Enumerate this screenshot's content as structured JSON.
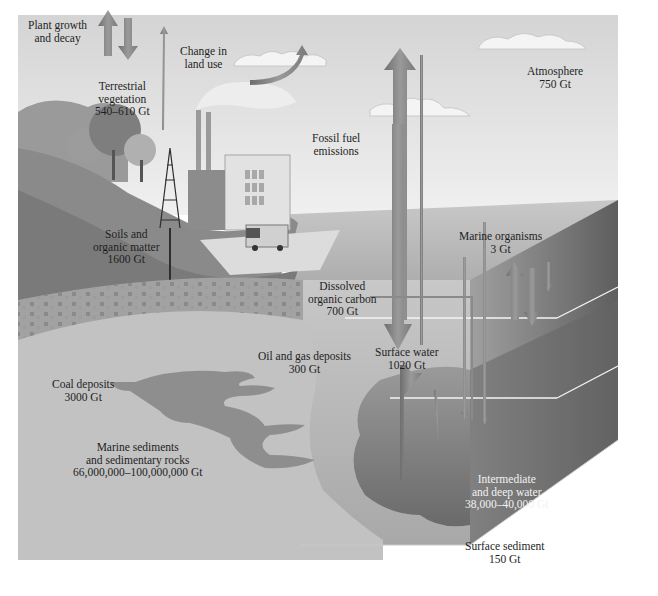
{
  "diagram": {
    "colors": {
      "sky_top": "#d6d6d6",
      "sky_bottom": "#ececec",
      "land": "#8c8c8c",
      "soil": "#7a7a7a",
      "sediment": "#bdbdbd",
      "ocean_surface": "#b4b4b4",
      "ocean_deep": "#6e6e6e",
      "arrow": "#8a8a8a",
      "text": "#1e1e1e"
    },
    "reservoirs": [
      {
        "id": "atmosphere",
        "lines": [
          "Atmosphere",
          "750 Gt"
        ]
      },
      {
        "id": "terrestrial-vegetation",
        "lines": [
          "Terrestrial",
          "vegetation",
          "540–610 Gt"
        ]
      },
      {
        "id": "soils",
        "lines": [
          "Soils and",
          "organic matter",
          "1600 Gt"
        ]
      },
      {
        "id": "dissolved-organic-carbon",
        "lines": [
          "Dissolved",
          "organic carbon",
          "700 Gt"
        ]
      },
      {
        "id": "marine-organisms",
        "lines": [
          "Marine organisms",
          "3 Gt"
        ]
      },
      {
        "id": "surface-water",
        "lines": [
          "Surface water",
          "1020 Gt"
        ]
      },
      {
        "id": "oil-gas",
        "lines": [
          "Oil and gas deposits",
          "300 Gt"
        ]
      },
      {
        "id": "coal",
        "lines": [
          "Coal deposits",
          "3000 Gt"
        ]
      },
      {
        "id": "marine-sediments",
        "lines": [
          "Marine sediments",
          "and sedimentary rocks",
          "66,000,000–100,000,000 Gt"
        ]
      },
      {
        "id": "deep-water",
        "lines": [
          "Intermediate",
          "and deep water",
          "38,000–40,000 Gt"
        ]
      },
      {
        "id": "surface-sediment",
        "lines": [
          "Surface sediment",
          "150 Gt"
        ]
      }
    ],
    "processes": [
      {
        "id": "plant-growth",
        "lines": [
          "Plant growth",
          "and decay"
        ]
      },
      {
        "id": "land-use",
        "lines": [
          "Change in",
          "land use"
        ]
      },
      {
        "id": "fossil-fuel",
        "lines": [
          "Fossil fuel",
          "emissions"
        ]
      }
    ]
  }
}
